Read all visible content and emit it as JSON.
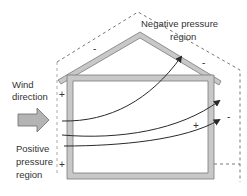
{
  "labels": {
    "negative_line1": "Negative pressure",
    "negative_line2": "region",
    "wind_line1": "Wind",
    "wind_line2": "direction",
    "positive_line1": "Positive",
    "positive_line2": "pressure",
    "positive_line3": "region"
  },
  "signs": {
    "roof_left": "-",
    "roof_right": "-",
    "left_wall_top": "+",
    "left_wall_bottom": "+",
    "right_exterior": "-",
    "interior": "+"
  },
  "colors": {
    "structure_fill": "#c8c8c8",
    "structure_stroke": "#7a7a7a",
    "airflow_line": "#2a2a2a",
    "dashed_boundary": "#555555",
    "wind_arrow_fill": "#b4b4b4"
  }
}
